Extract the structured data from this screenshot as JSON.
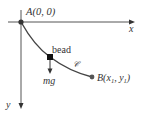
{
  "diagram": {
    "colors": {
      "axis": "#555555",
      "curve": "#444444",
      "bead": "#111111",
      "point": "#555555",
      "text": "#333333"
    },
    "labels": {
      "origin": "A(0, 0)",
      "x_axis": "x",
      "y_axis": "y",
      "bead": "bead",
      "force": "mg",
      "curve": "𝒞",
      "endpoint": "B(x",
      "endpoint_sub1": "1",
      "endpoint_mid": ", y",
      "endpoint_sub2": "1",
      "endpoint_close": ")"
    }
  }
}
